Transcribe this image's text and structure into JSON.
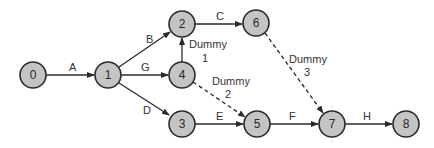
{
  "diagram": {
    "type": "activity-on-arrow network",
    "nodes": [
      {
        "id": "0",
        "x": 33,
        "y": 75
      },
      {
        "id": "1",
        "x": 108,
        "y": 75
      },
      {
        "id": "2",
        "x": 182,
        "y": 24
      },
      {
        "id": "3",
        "x": 182,
        "y": 124
      },
      {
        "id": "4",
        "x": 182,
        "y": 75
      },
      {
        "id": "5",
        "x": 257,
        "y": 124
      },
      {
        "id": "6",
        "x": 256,
        "y": 23
      },
      {
        "id": "7",
        "x": 332,
        "y": 124
      },
      {
        "id": "8",
        "x": 406,
        "y": 124
      }
    ],
    "edges": [
      {
        "from": "0",
        "to": "1",
        "label": "A",
        "dummy": false
      },
      {
        "from": "1",
        "to": "2",
        "label": "B",
        "dummy": false
      },
      {
        "from": "1",
        "to": "4",
        "label": "G",
        "dummy": false
      },
      {
        "from": "1",
        "to": "3",
        "label": "D",
        "dummy": false
      },
      {
        "from": "2",
        "to": "6",
        "label": "C",
        "dummy": false
      },
      {
        "from": "4",
        "to": "2",
        "label": "Dummy 1",
        "dummy": true
      },
      {
        "from": "4",
        "to": "5",
        "label": "Dummy 2",
        "dummy": true
      },
      {
        "from": "3",
        "to": "5",
        "label": "E",
        "dummy": false
      },
      {
        "from": "6",
        "to": "7",
        "label": "Dummy 3",
        "dummy": true
      },
      {
        "from": "5",
        "to": "7",
        "label": "F",
        "dummy": false
      },
      {
        "from": "7",
        "to": "8",
        "label": "H",
        "dummy": false
      }
    ],
    "labels": {
      "A": "A",
      "B": "B",
      "C": "C",
      "D": "D",
      "E": "E",
      "F": "F",
      "G": "G",
      "H": "H",
      "dummy1_word": "Dummy",
      "dummy1_num": "1",
      "dummy2_word": "Dummy",
      "dummy2_num": "2",
      "dummy3_word": "Dummy",
      "dummy3_num": "3"
    },
    "colors": {
      "node_fill": "#c4c4c4",
      "stroke": "#2a2a2a",
      "background": "#ffffff"
    }
  }
}
